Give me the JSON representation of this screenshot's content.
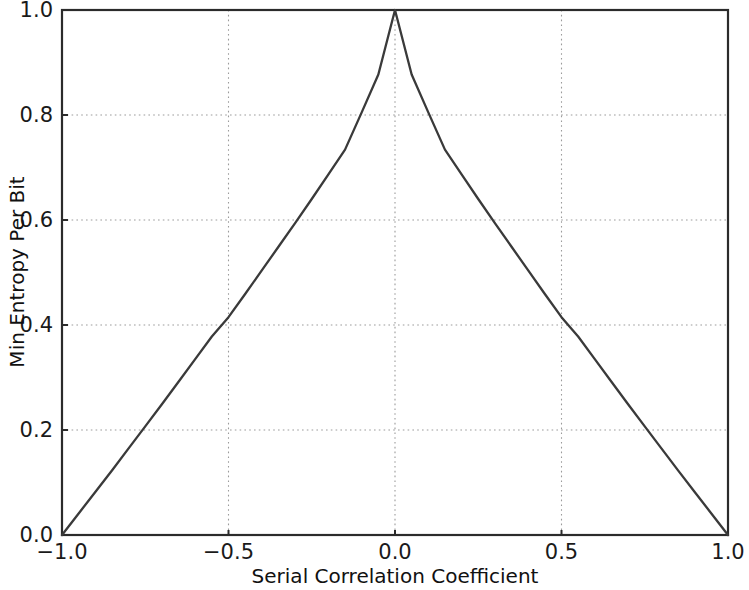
{
  "figure": {
    "background_color": "#ffffff",
    "line_color": "#3a3a3a",
    "grid_color": "#9b9b9b",
    "axis_color": "#2b2b2b"
  },
  "axes": {
    "xlabel": "Serial Correlation Coefficient",
    "ylabel": "Min Entropy Per Bit",
    "xticklabels": [
      "−1.0",
      "−0.5",
      "0.0",
      "0.5",
      "1.0"
    ],
    "yticklabels": [
      "0.0",
      "0.2",
      "0.4",
      "0.6",
      "0.8",
      "1.0"
    ]
  },
  "chart_data": {
    "type": "line",
    "title": "",
    "subtitle": "",
    "xlabel": "Serial Correlation Coefficient",
    "ylabel": "Min Entropy Per Bit",
    "xlim": [
      -1.0,
      1.0
    ],
    "ylim": [
      0.0,
      1.0
    ],
    "xticks": [
      -1.0,
      -0.5,
      0.0,
      0.5,
      1.0
    ],
    "yticks": [
      0.0,
      0.2,
      0.4,
      0.6,
      0.8,
      1.0
    ],
    "grid": true,
    "legend": null,
    "legend_position": "none",
    "annotations": [],
    "series": [
      {
        "name": "Min entropy per bit",
        "color": "#3a3a3a",
        "linewidth": 1.5,
        "x": [
          -1.0,
          -0.95,
          -0.9,
          -0.85,
          -0.8,
          -0.75,
          -0.7,
          -0.65,
          -0.6,
          -0.55,
          -0.5,
          -0.45,
          -0.4,
          -0.35,
          -0.3,
          -0.25,
          -0.2,
          -0.15,
          -0.1,
          -0.05,
          0.0,
          0.05,
          0.1,
          0.15,
          0.2,
          0.25,
          0.3,
          0.35,
          0.4,
          0.45,
          0.5,
          0.55,
          0.6,
          0.65,
          0.7,
          0.75,
          0.8,
          0.85,
          0.9,
          0.95,
          1.0
        ],
        "y": [
          0.0,
          0.041,
          0.082,
          0.123,
          0.165,
          0.207,
          0.249,
          0.292,
          0.335,
          0.378,
          0.415,
          0.459,
          0.504,
          0.549,
          0.594,
          0.64,
          0.687,
          0.734,
          0.805,
          0.877,
          1.0,
          0.877,
          0.805,
          0.734,
          0.687,
          0.64,
          0.594,
          0.549,
          0.504,
          0.459,
          0.415,
          0.378,
          0.335,
          0.292,
          0.249,
          0.207,
          0.165,
          0.123,
          0.082,
          0.041,
          0.0
        ]
      }
    ]
  }
}
